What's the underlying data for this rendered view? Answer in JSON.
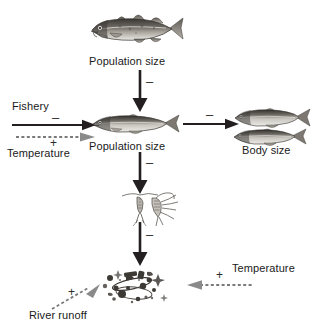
{
  "diagram": {
    "background_color": "#ffffff",
    "ink_color": "#231f20",
    "dotted_color": "#6f6f6f"
  },
  "nodes": [
    {
      "id": "cod",
      "label": "Population size",
      "organism": "atlantic-cod",
      "icon_name": "cod-fish-icon"
    },
    {
      "id": "herring_population",
      "label": "Population size",
      "organism": "herring",
      "icon_name": "herring-fish-icon"
    },
    {
      "id": "herring_body_size",
      "label": "Body size",
      "organism": "herring-pair",
      "icon_name": "herring-pair-icon"
    },
    {
      "id": "zooplankton",
      "label": "",
      "organism": "copepod",
      "icon_name": "zooplankton-icon"
    },
    {
      "id": "phytoplankton",
      "label": "",
      "organism": "diatoms",
      "icon_name": "phytoplankton-icon"
    }
  ],
  "drivers": [
    {
      "id": "fishery",
      "label": "Fishery",
      "sign": "–",
      "style": "solid"
    },
    {
      "id": "temperature_upper",
      "label": "Temperature",
      "sign": "+",
      "style": "dotted"
    },
    {
      "id": "temperature_lower",
      "label": "Temperature",
      "sign": "+",
      "style": "dotted"
    },
    {
      "id": "river_runoff",
      "label": "River runoff",
      "sign": "+",
      "style": "dotted"
    }
  ],
  "edges": [
    {
      "id": "cod-to-herring",
      "from": "cod",
      "to": "herring_population",
      "sign": "–",
      "style": "solid",
      "direction": "down"
    },
    {
      "id": "herring-to-bodysize",
      "from": "herring_population",
      "to": "herring_body_size",
      "sign": "–",
      "style": "solid",
      "direction": "right"
    },
    {
      "id": "herring-to-zooplankton",
      "from": "herring_population",
      "to": "zooplankton",
      "sign": "–",
      "style": "solid",
      "direction": "down"
    },
    {
      "id": "zooplankton-to-phytoplankton",
      "from": "zooplankton",
      "to": "phytoplankton",
      "sign": "–",
      "style": "solid",
      "direction": "down"
    },
    {
      "id": "fishery-to-herring",
      "from": "fishery",
      "to": "herring_population",
      "sign": "–",
      "style": "solid",
      "direction": "right"
    },
    {
      "id": "temperature-to-herring",
      "from": "temperature_upper",
      "to": "herring_population",
      "sign": "+",
      "style": "dotted",
      "direction": "right"
    },
    {
      "id": "temperature-to-phytoplankton",
      "from": "temperature_lower",
      "to": "phytoplankton",
      "sign": "+",
      "style": "dotted",
      "direction": "left"
    },
    {
      "id": "runoff-to-phytoplankton",
      "from": "river_runoff",
      "to": "phytoplankton",
      "sign": "+",
      "style": "dotted",
      "direction": "upright"
    }
  ]
}
